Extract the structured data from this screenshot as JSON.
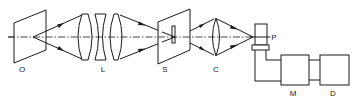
{
  "diagram": {
    "title": "",
    "components": [
      {
        "id": "O",
        "label": "O",
        "kind": "object-plane"
      },
      {
        "id": "L",
        "label": "L",
        "kind": "lens-group"
      },
      {
        "id": "S",
        "label": "S",
        "kind": "slit-plane"
      },
      {
        "id": "C",
        "label": "C",
        "kind": "condenser-lens"
      },
      {
        "id": "P",
        "label": "P",
        "kind": "photodetector"
      },
      {
        "id": "M",
        "label": "M",
        "kind": "module"
      },
      {
        "id": "D",
        "label": "D",
        "kind": "module"
      }
    ],
    "colors": {
      "line": "#1a1a1a",
      "background": "#ffffff"
    }
  }
}
